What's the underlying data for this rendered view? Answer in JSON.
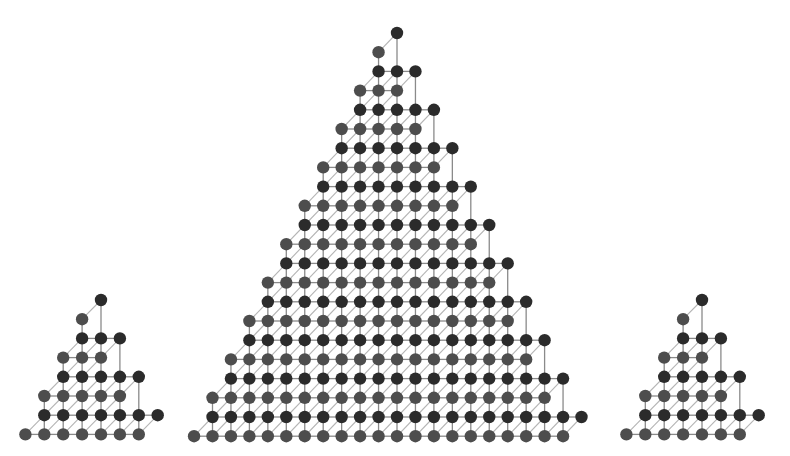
{
  "diagram": {
    "type": "sheared-triangular-lattice",
    "colors": {
      "background": "#ffffff",
      "node_dark": "#2b2b2b",
      "node_grey": "#4d4d4d",
      "edge": "#8a8a8a",
      "edge_diagonal": "#b4b4b4"
    },
    "node_radius": 6.2,
    "triangles": [
      {
        "name": "small-left",
        "apex_x": 101,
        "apex_y": 300,
        "pairs": 4,
        "dx": 18.9,
        "dy": 19.2
      },
      {
        "name": "large-center",
        "apex_x": 397,
        "apex_y": 33,
        "pairs": 11,
        "dx": 18.45,
        "dy": 19.2
      },
      {
        "name": "small-right",
        "apex_x": 702,
        "apex_y": 300,
        "pairs": 4,
        "dx": 18.9,
        "dy": 19.2
      }
    ]
  }
}
